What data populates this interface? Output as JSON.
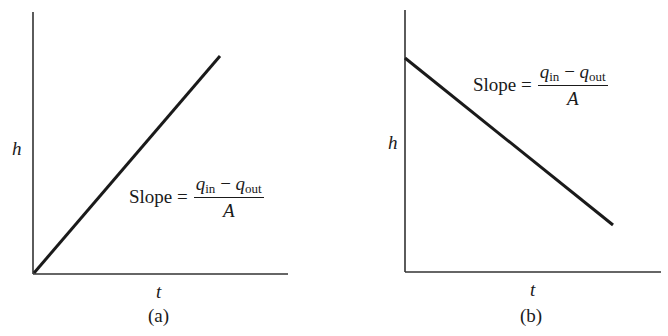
{
  "chart_data": [
    {
      "id": "a",
      "type": "line",
      "title": "",
      "caption": "(a)",
      "xlabel": "t",
      "ylabel": "h",
      "grid": false,
      "legend": "none",
      "series": [
        {
          "name": "h(t)",
          "x": [
            0,
            1
          ],
          "y": [
            0,
            1
          ],
          "trend": "increasing"
        }
      ],
      "annotation": {
        "text": "Slope =",
        "numerator": {
          "q1": "q",
          "sub1": "in",
          "minus": " − ",
          "q2": "q",
          "sub2": "out"
        },
        "denominator": "A"
      }
    },
    {
      "id": "b",
      "type": "line",
      "title": "",
      "caption": "(b)",
      "xlabel": "t",
      "ylabel": "h",
      "grid": false,
      "legend": "none",
      "series": [
        {
          "name": "h(t)",
          "x": [
            0,
            1
          ],
          "y": [
            0.82,
            0.18
          ],
          "trend": "decreasing"
        }
      ],
      "annotation": {
        "text": "Slope =",
        "numerator": {
          "q1": "q",
          "sub1": "in",
          "minus": " − ",
          "q2": "q",
          "sub2": "out"
        },
        "denominator": "A"
      }
    }
  ],
  "colors": {
    "ink": "#1a1a1a",
    "background": "#ffffff"
  }
}
